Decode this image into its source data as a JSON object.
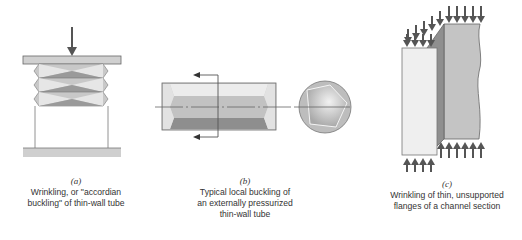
{
  "figures": [
    {
      "id": "a",
      "label": "(a)",
      "caption_lines": [
        "Wrinkling, or \"accordian",
        "buckling\" of thin-wall tube"
      ]
    },
    {
      "id": "b",
      "label": "(b)",
      "caption_lines": [
        "Typical local buckling of",
        "an externally pressurized",
        "thin-wall tube"
      ]
    },
    {
      "id": "c",
      "label": "(c)",
      "caption_lines": [
        "Wrinkling of thin, unsupported",
        "flanges of a channel section"
      ]
    }
  ],
  "colors": {
    "light_gray": "#d9d9d9",
    "mid_gray": "#b3b3b3",
    "dark_gray": "#7f7f7f",
    "arrow": "#555555",
    "line": "#555555",
    "plate": "#cfcfcf"
  }
}
